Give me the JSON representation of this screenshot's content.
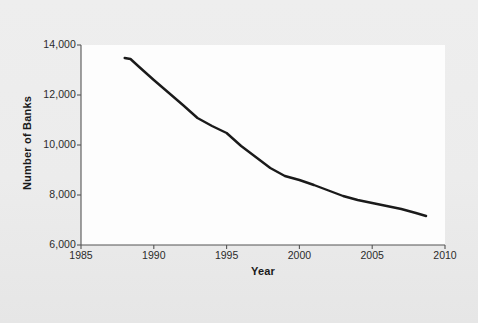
{
  "chart_data": {
    "type": "line",
    "title": "",
    "subtitle": "",
    "xlabel": "Year",
    "ylabel": "Number of Banks",
    "xlim": [
      1985,
      2010
    ],
    "ylim": [
      6000,
      14000
    ],
    "xticks": [
      1985,
      1990,
      1995,
      2000,
      2005,
      2010
    ],
    "xtick_labels": [
      "1985",
      "1990",
      "1995",
      "2000",
      "2005",
      "2010"
    ],
    "yticks": [
      6000,
      8000,
      10000,
      12000,
      14000
    ],
    "ytick_labels": [
      "6,000",
      "8,000",
      "10,000",
      "12,000",
      "14,000"
    ],
    "grid": false,
    "legend": null,
    "legend_position": "none",
    "series": [
      {
        "name": "Number of Banks",
        "color": "#1a1a1a",
        "line_width": 2.4,
        "x": [
          1988,
          1988.4,
          1989,
          1990,
          1991,
          1992,
          1993,
          1994,
          1995,
          1996,
          1997,
          1998,
          1999,
          2000,
          2001,
          2002,
          2003,
          2004,
          2005,
          2006,
          2007,
          2008,
          2008.7
        ],
        "values": [
          13480,
          13440,
          13120,
          12600,
          12100,
          11600,
          11080,
          10760,
          10480,
          9960,
          9520,
          9080,
          8760,
          8600,
          8400,
          8180,
          7960,
          7800,
          7680,
          7560,
          7440,
          7280,
          7160
        ]
      }
    ]
  },
  "axes": {
    "tick_color": "#2b2b2b",
    "axis_color": "#555555",
    "plot_background": "#fdfdfd",
    "figure_background": "#ebebeb"
  }
}
